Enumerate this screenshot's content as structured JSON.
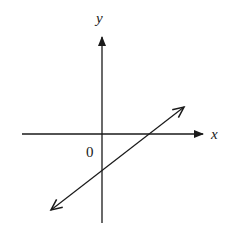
{
  "diagram": {
    "type": "coordinate-plane",
    "colors": {
      "stroke": "#1a1a1a",
      "background": "#ffffff"
    },
    "axes": {
      "x": {
        "label": "x",
        "start": [
          22,
          134
        ],
        "end": [
          203,
          134
        ],
        "arrow": "end"
      },
      "y": {
        "label": "y",
        "start": [
          102,
          223
        ],
        "end": [
          102,
          37
        ],
        "arrow": "end"
      }
    },
    "origin_label": "0",
    "line": {
      "slope_sign": "positive",
      "x_intercept": "positive",
      "y_intercept": "negative",
      "start": [
        51,
        210
      ],
      "end": [
        184,
        107
      ],
      "arrows": "both"
    }
  }
}
